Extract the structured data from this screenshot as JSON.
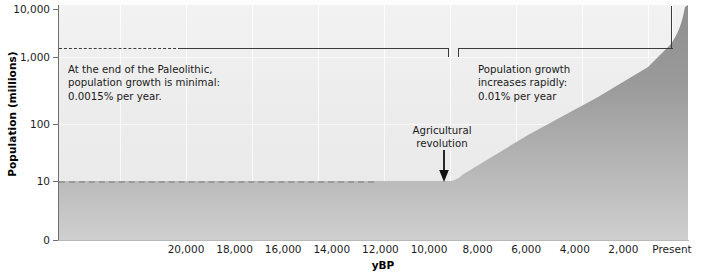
{
  "chart_data": {
    "type": "area",
    "title": "",
    "xlabel": "yBP",
    "ylabel": "Population (millions)",
    "y_scale": "log",
    "y_ticks": [
      "10,000",
      "1,000",
      "100",
      "10",
      "0"
    ],
    "y_tick_values": [
      10000,
      1000,
      100,
      10,
      0
    ],
    "x_ticks": [
      "20,000",
      "18,000",
      "16,000",
      "14,000",
      "12,000",
      "10,000",
      "8,000",
      "6,000",
      "4,000",
      "2,000",
      "Present"
    ],
    "x_tick_values": [
      20000,
      18000,
      16000,
      14000,
      12000,
      10000,
      8000,
      6000,
      4000,
      2000,
      0
    ],
    "xlim": [
      22000,
      0
    ],
    "ylim": [
      0,
      10000
    ],
    "grid": true,
    "legend": "none",
    "series": [
      {
        "name": "World population",
        "x": [
          22000,
          20000,
          18000,
          16000,
          14000,
          12000,
          10500,
          10000,
          9000,
          8000,
          6000,
          4000,
          2000,
          1000,
          500,
          200,
          100,
          50,
          0
        ],
        "values": [
          8,
          8,
          8,
          9,
          9,
          10,
          10,
          10,
          14,
          20,
          40,
          70,
          170,
          300,
          500,
          1000,
          1700,
          2500,
          7000
        ]
      }
    ],
    "annotations": [
      {
        "name": "paleolithic-note",
        "text": "At the end of the Paleolithic, population growth is minimal: 0.0015% per year.",
        "lines": [
          "At the end of the Paleolithic,",
          "population growth is minimal:",
          "0.0015% per year."
        ]
      },
      {
        "name": "growth-note",
        "text": "Population growth increases rapidly: 0.01% per year",
        "lines": [
          "Population growth",
          "increases rapidly:",
          "0.01% per year"
        ]
      },
      {
        "name": "agricultural-revolution",
        "text": "Agricultural revolution",
        "lines": [
          "Agricultural",
          "revolution"
        ],
        "points_to_x": 10000
      }
    ],
    "colors": {
      "plot_background": "#efefef",
      "area_fill": "#9a9a9a",
      "axis": "#6f6f6f",
      "text": "#1a1a1a",
      "bracket": "#3b3b3b",
      "gridline": "#ffffff"
    }
  },
  "axes": {
    "y_title": "Population (millions)",
    "x_title": "yBP",
    "y_labels": [
      "10,000",
      "1,000",
      "100",
      "10",
      "0"
    ],
    "x_labels": [
      "20,000",
      "18,000",
      "16,000",
      "14,000",
      "12,000",
      "10,000",
      "8,000",
      "6,000",
      "4,000",
      "2,000",
      "Present"
    ]
  },
  "notes": {
    "left": {
      "line1": "At the end of the Paleolithic,",
      "line2": "population growth is minimal:",
      "line3": "0.0015% per year."
    },
    "right": {
      "line1": "Population growth",
      "line2": "increases rapidly:",
      "line3": "0.01% per year"
    },
    "marker": {
      "line1": "Agricultural",
      "line2": "revolution"
    }
  }
}
